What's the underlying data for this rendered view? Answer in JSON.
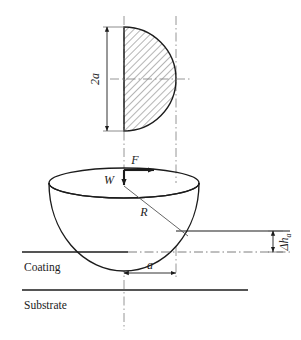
{
  "figure": {
    "type": "technical-diagram",
    "title": ""
  },
  "labels": {
    "diameter": "2a",
    "normal_force": "F",
    "load": "W",
    "radius": "R",
    "contact_radius": "a",
    "height_change": "Δh",
    "height_change_sub": "a",
    "coating": "Coating",
    "substrate": "Substrate"
  },
  "colors": {
    "line": "#1c1c1c",
    "hatch": "#555555",
    "centerline": "#777777",
    "background": "#ffffff"
  },
  "geometry": {
    "semicircle": {
      "flat_edge_x": 124,
      "center_y": 79,
      "radius": 52,
      "top_y": 27,
      "bottom_y": 131
    },
    "bowl": {
      "center_x": 124,
      "rim_y": 183,
      "bottom_y": 252,
      "rim_rx": 75,
      "rim_ry": 15
    },
    "centerline_left_x": 124,
    "centerline_right_x": 176,
    "coating_line_y": 252,
    "substrate_line_y": 290,
    "delta_h_top_y": 231,
    "delta_h_bottom_y": 252
  }
}
